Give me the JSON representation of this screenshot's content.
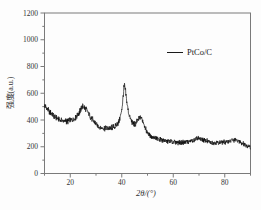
{
  "figure": {
    "background_color": "#fdfdfd",
    "frame_color": "#7a7a7a",
    "text_color": "#333333"
  },
  "chart_data": {
    "type": "line",
    "title": "",
    "xlabel": "2θ/(°)",
    "ylabel": "强度(a.u.)",
    "xlim": [
      10,
      90
    ],
    "ylim": [
      0,
      1200
    ],
    "x_major_ticks": [
      20,
      40,
      60,
      80
    ],
    "x_minor_ticks": [
      10,
      30,
      50,
      70,
      90
    ],
    "y_major_ticks": [
      0,
      200,
      400,
      600,
      800,
      1000,
      1200
    ],
    "y_minor_ticks": [
      100,
      300,
      500,
      700,
      900,
      1100
    ],
    "grid": false,
    "legend_position": "upper-right",
    "series": [
      {
        "name": "PtCo/C",
        "color": "#0a0a0a",
        "noise_amplitude": 16,
        "anchors": [
          [
            10,
            512
          ],
          [
            11,
            482
          ],
          [
            12,
            460
          ],
          [
            13,
            442
          ],
          [
            14,
            425
          ],
          [
            15,
            410
          ],
          [
            16,
            400
          ],
          [
            17,
            394
          ],
          [
            18,
            390
          ],
          [
            19,
            392
          ],
          [
            20,
            396
          ],
          [
            21,
            404
          ],
          [
            22,
            418
          ],
          [
            23,
            442
          ],
          [
            24,
            478
          ],
          [
            24.7,
            505
          ],
          [
            25.3,
            500
          ],
          [
            26,
            482
          ],
          [
            27,
            452
          ],
          [
            28,
            420
          ],
          [
            29,
            392
          ],
          [
            30,
            368
          ],
          [
            31,
            352
          ],
          [
            32,
            344
          ],
          [
            33,
            338
          ],
          [
            34,
            336
          ],
          [
            35,
            338
          ],
          [
            36,
            342
          ],
          [
            37,
            348
          ],
          [
            38,
            362
          ],
          [
            39,
            392
          ],
          [
            39.7,
            440
          ],
          [
            40.2,
            510
          ],
          [
            40.7,
            610
          ],
          [
            41.0,
            665
          ],
          [
            41.4,
            620
          ],
          [
            42,
            530
          ],
          [
            42.6,
            460
          ],
          [
            43.2,
            415
          ],
          [
            44,
            385
          ],
          [
            44.7,
            368
          ],
          [
            45.4,
            375
          ],
          [
            46.2,
            398
          ],
          [
            46.9,
            415
          ],
          [
            47.4,
            420
          ],
          [
            48,
            403
          ],
          [
            48.7,
            368
          ],
          [
            49.4,
            330
          ],
          [
            50.2,
            300
          ],
          [
            51,
            283
          ],
          [
            52,
            270
          ],
          [
            54,
            258
          ],
          [
            56,
            248
          ],
          [
            58,
            241
          ],
          [
            60,
            236
          ],
          [
            62,
            233
          ],
          [
            64,
            233
          ],
          [
            66,
            238
          ],
          [
            67.5,
            246
          ],
          [
            69,
            258
          ],
          [
            70,
            262
          ],
          [
            71,
            256
          ],
          [
            72.5,
            245
          ],
          [
            74,
            236
          ],
          [
            76,
            230
          ],
          [
            78,
            230
          ],
          [
            80,
            235
          ],
          [
            81.5,
            242
          ],
          [
            83,
            249
          ],
          [
            84.2,
            250
          ],
          [
            85.5,
            241
          ],
          [
            87,
            226
          ],
          [
            88.5,
            212
          ],
          [
            90,
            196
          ]
        ]
      }
    ]
  }
}
